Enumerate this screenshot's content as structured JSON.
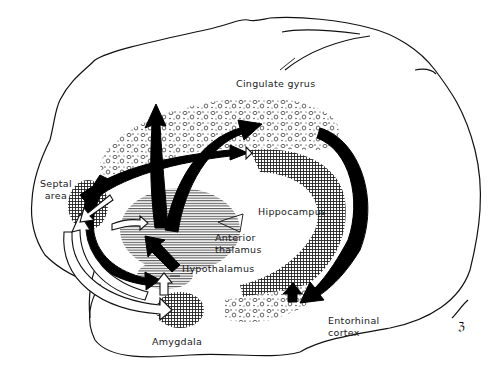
{
  "diagram": {
    "structures": [
      {
        "id": "cingulate",
        "label": "Cingulate gyrus",
        "texture": "stippled-circles"
      },
      {
        "id": "septal",
        "label_lines": [
          "Septal",
          "area"
        ],
        "texture": "crosshatch"
      },
      {
        "id": "hippocampus",
        "label": "Hippocampus",
        "texture": "crosshatch"
      },
      {
        "id": "anterior_thalamus",
        "label_lines": [
          "Anterior",
          "thalamus"
        ],
        "texture": "horizontal-lines"
      },
      {
        "id": "hypothalamus",
        "label": "Hypothalamus",
        "texture": "horizontal-lines"
      },
      {
        "id": "amygdala",
        "label": "Amygdala",
        "texture": "crosshatch"
      },
      {
        "id": "entorhinal",
        "label_lines": [
          "Entorhinal",
          "cortex"
        ],
        "texture": "stippled-circles"
      }
    ],
    "arrows": [
      {
        "from": "Hypothalamus",
        "to": "Anterior thalamus",
        "style": "black"
      },
      {
        "from": "Anterior thalamus",
        "to": "Cingulate gyrus",
        "style": "black"
      },
      {
        "from": "Cingulate gyrus",
        "to": "Entorhinal cortex",
        "style": "black"
      },
      {
        "from": "Entorhinal cortex",
        "to": "Hippocampus",
        "style": "black"
      },
      {
        "from": "Hippocampus",
        "to": "Hypothalamus",
        "style": "black"
      },
      {
        "from": "Septal area",
        "to": "Hippocampus",
        "style": "black"
      },
      {
        "from": "Amygdala",
        "to": "Hypothalamus",
        "style": "white"
      },
      {
        "from": "Amygdala",
        "to": "Septal area",
        "style": "white"
      },
      {
        "from": "Septal area",
        "to": "Amygdala",
        "style": "white"
      }
    ],
    "signature": "ℨ",
    "colors": {
      "ink": "#111111",
      "background": "#ffffff",
      "texture": "#333333"
    }
  }
}
